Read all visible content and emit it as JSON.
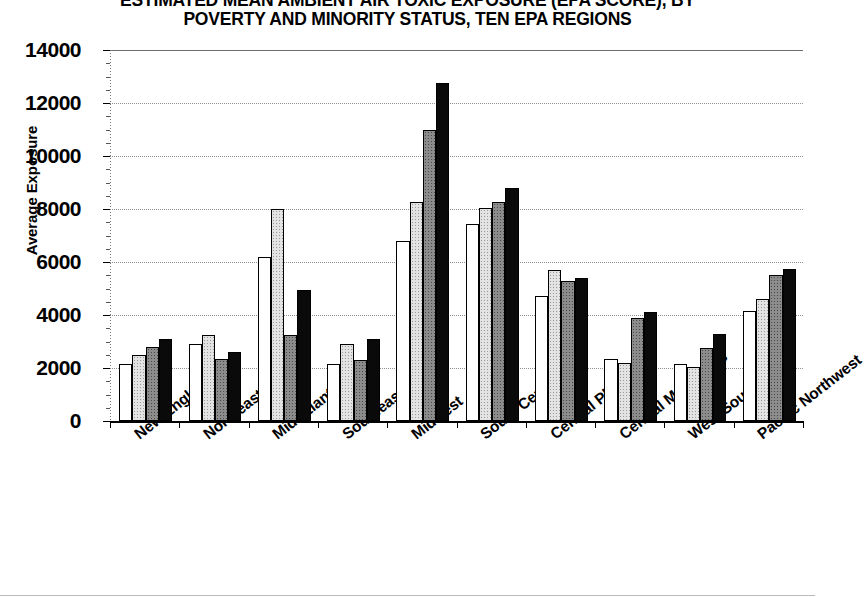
{
  "chart_data": {
    "type": "bar",
    "title": "ESTIMATED MEAN AMBIENT AIR TOXIC EXPOSURE (EPA SCORE), BY POVERTY AND MINORITY STATUS, TEN EPA REGIONS",
    "title_lines": [
      "ESTIMATED MEAN AMBIENT AIR TOXIC EXPOSURE (EPA SCORE), BY",
      "POVERTY AND MINORITY STATUS, TEN EPA REGIONS"
    ],
    "xlabel": "",
    "ylabel": "Average Exposure",
    "ylim": [
      0,
      14000
    ],
    "ytick_step": 2000,
    "yticks": [
      0,
      2000,
      4000,
      6000,
      8000,
      10000,
      12000,
      14000
    ],
    "ytick_labels": [
      "0",
      "2000",
      "4000",
      "6000",
      "8000",
      "10000",
      "12000",
      "14000"
    ],
    "grid": true,
    "legend": false,
    "legend_position": "none",
    "categories": [
      "New England",
      "Northeast",
      "Mid Atlantic",
      "Southeast",
      "Midwest",
      "South Central",
      "Central Plains",
      "Central Mountains",
      "West/Southwest",
      "Pacific Northwest"
    ],
    "series": [
      {
        "name": "series-1",
        "fill": "white",
        "values": [
          2150,
          2900,
          6200,
          2150,
          6800,
          7450,
          4700,
          2350,
          2150,
          4150
        ]
      },
      {
        "name": "series-2",
        "fill": "light-gray",
        "values": [
          2500,
          3250,
          8000,
          2900,
          8250,
          8050,
          5700,
          2200,
          2050,
          4600
        ]
      },
      {
        "name": "series-3",
        "fill": "dark-gray",
        "values": [
          2800,
          2350,
          3250,
          2300,
          11000,
          8250,
          5300,
          3900,
          2750,
          5500
        ]
      },
      {
        "name": "series-4",
        "fill": "black",
        "values": [
          3100,
          2600,
          4950,
          3100,
          12750,
          8800,
          5400,
          4100,
          3300,
          5750
        ]
      }
    ]
  },
  "colors": {
    "series_1": "#ffffff",
    "series_2": "#e3e3e3",
    "series_3": "#8c8c8c",
    "series_4": "#0a0a0a",
    "axis": "#000000",
    "grid": "#909090",
    "background": "#ffffff"
  }
}
